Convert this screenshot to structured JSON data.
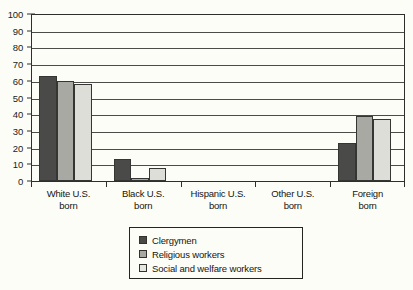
{
  "chart_data": {
    "type": "bar",
    "title": "",
    "xlabel": "",
    "ylabel": "",
    "ylim": [
      0,
      100
    ],
    "yticks": [
      0,
      10,
      20,
      30,
      40,
      50,
      60,
      70,
      80,
      90,
      100
    ],
    "ytick_labels": [
      "0",
      "10",
      "20",
      "30",
      "40",
      "50",
      "60",
      "70",
      "80",
      "90",
      "100"
    ],
    "grid": true,
    "legend_position": "bottom-center",
    "categories": [
      "White U.S. born",
      "Black U.S. born",
      "Hispanic U.S. born",
      "Other U.S. born",
      "Foreign born"
    ],
    "category_lines": [
      [
        "White U.S.",
        "born"
      ],
      [
        "Black U.S.",
        "born"
      ],
      [
        "Hispanic U.S.",
        "born"
      ],
      [
        "Other U.S.",
        "born"
      ],
      [
        "Foreign",
        "born"
      ]
    ],
    "series": [
      {
        "name": "Clergymen",
        "color": "#4a4a48",
        "values": [
          63,
          13,
          0,
          0,
          23
        ]
      },
      {
        "name": "Religious workers",
        "color": "#a9a9a4",
        "values": [
          60,
          2,
          0,
          0,
          39
        ]
      },
      {
        "name": "Social and welfare workers",
        "color": "#dedeD9",
        "values": [
          58,
          8,
          0,
          0,
          37
        ]
      }
    ]
  },
  "legend": {
    "items": [
      {
        "label": "Clergymen",
        "color": "#4a4a48"
      },
      {
        "label": "Religious workers",
        "color": "#a9a9a4"
      },
      {
        "label": "Social and welfare workers",
        "color": "#e6e6e1"
      }
    ]
  }
}
